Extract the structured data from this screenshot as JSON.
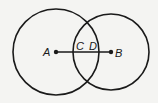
{
  "diagram": {
    "background": "#f4f4f2",
    "stroke_color": "#1a1a1a",
    "circles": [
      {
        "name": "circle-A",
        "center": "A",
        "cx": 56,
        "cy": 52,
        "r": 43
      },
      {
        "name": "circle-B",
        "center": "B",
        "cx": 111,
        "cy": 52,
        "r": 38
      }
    ],
    "segment": {
      "from": "A",
      "to": "B",
      "x1": 56,
      "y1": 52,
      "x2": 111,
      "y2": 52
    },
    "points": [
      {
        "label": "A",
        "x": 56,
        "y": 52,
        "dot": true
      },
      {
        "label": "B",
        "x": 111,
        "y": 52,
        "dot": true
      },
      {
        "label": "C",
        "x": 79,
        "y": 47,
        "dot": false
      },
      {
        "label": "D",
        "x": 93,
        "y": 47,
        "dot": false
      }
    ]
  }
}
